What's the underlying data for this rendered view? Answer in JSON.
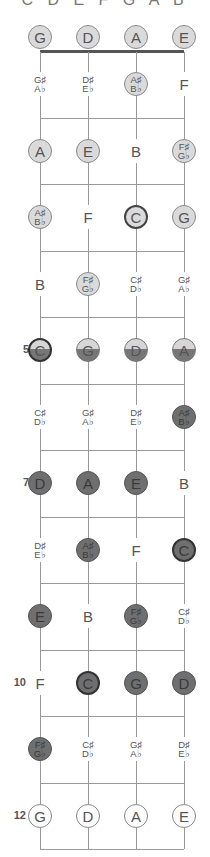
{
  "header": {
    "scale": "C D E F G A B"
  },
  "strings": [
    "G",
    "D",
    "A",
    "E"
  ],
  "colors": {
    "root_light": "#dadada",
    "scale_dark": "#6f6f6f",
    "line": "#9a9a9a",
    "nut": "#555555"
  },
  "fret_markers": [
    {
      "fret": 5,
      "label": "5"
    },
    {
      "fret": 7,
      "label": "7"
    },
    {
      "fret": 10,
      "label": "10"
    },
    {
      "fret": 12,
      "label": "12"
    }
  ],
  "frets": [
    {
      "fret": 0,
      "notes": [
        {
          "n": "G",
          "style": "light"
        },
        {
          "n": "D",
          "style": "light"
        },
        {
          "n": "A",
          "style": "light"
        },
        {
          "n": "E",
          "style": "light"
        }
      ]
    },
    {
      "fret": 1,
      "notes": [
        {
          "n": "G♯",
          "n2": "A♭",
          "style": "plain"
        },
        {
          "n": "D♯",
          "n2": "E♭",
          "style": "plain"
        },
        {
          "n": "A♯",
          "n2": "B♭",
          "style": "light"
        },
        {
          "n": "F",
          "style": "plain"
        }
      ]
    },
    {
      "fret": 2,
      "notes": [
        {
          "n": "A",
          "style": "light"
        },
        {
          "n": "E",
          "style": "light"
        },
        {
          "n": "B",
          "style": "plain"
        },
        {
          "n": "F♯",
          "n2": "G♭",
          "style": "light"
        }
      ]
    },
    {
      "fret": 3,
      "notes": [
        {
          "n": "A♯",
          "n2": "B♭",
          "style": "light"
        },
        {
          "n": "F",
          "style": "plain"
        },
        {
          "n": "C",
          "style": "light-strong"
        },
        {
          "n": "G",
          "style": "light"
        }
      ]
    },
    {
      "fret": 4,
      "notes": [
        {
          "n": "B",
          "style": "plain"
        },
        {
          "n": "F♯",
          "n2": "G♭",
          "style": "light"
        },
        {
          "n": "C♯",
          "n2": "D♭",
          "style": "plain"
        },
        {
          "n": "G♯",
          "n2": "A♭",
          "style": "plain"
        }
      ]
    },
    {
      "fret": 5,
      "notes": [
        {
          "n": "C",
          "style": "half-strong"
        },
        {
          "n": "G",
          "style": "half"
        },
        {
          "n": "D",
          "style": "half"
        },
        {
          "n": "A",
          "style": "half"
        }
      ]
    },
    {
      "fret": 6,
      "notes": [
        {
          "n": "C♯",
          "n2": "D♭",
          "style": "plain"
        },
        {
          "n": "G♯",
          "n2": "A♭",
          "style": "plain"
        },
        {
          "n": "D♯",
          "n2": "E♭",
          "style": "plain"
        },
        {
          "n": "A♯",
          "n2": "B♭",
          "style": "dark"
        }
      ]
    },
    {
      "fret": 7,
      "notes": [
        {
          "n": "D",
          "style": "dark"
        },
        {
          "n": "A",
          "style": "dark"
        },
        {
          "n": "E",
          "style": "dark"
        },
        {
          "n": "B",
          "style": "plain"
        }
      ]
    },
    {
      "fret": 8,
      "notes": [
        {
          "n": "D♯",
          "n2": "E♭",
          "style": "plain"
        },
        {
          "n": "A♯",
          "n2": "B♭",
          "style": "dark"
        },
        {
          "n": "F",
          "style": "plain"
        },
        {
          "n": "C",
          "style": "dark-strong"
        }
      ]
    },
    {
      "fret": 9,
      "notes": [
        {
          "n": "E",
          "style": "dark"
        },
        {
          "n": "B",
          "style": "plain"
        },
        {
          "n": "F♯",
          "n2": "G♭",
          "style": "dark"
        },
        {
          "n": "C♯",
          "n2": "D♭",
          "style": "plain"
        }
      ]
    },
    {
      "fret": 10,
      "notes": [
        {
          "n": "F",
          "style": "plain"
        },
        {
          "n": "C",
          "style": "dark-strong"
        },
        {
          "n": "G",
          "style": "dark"
        },
        {
          "n": "D",
          "style": "dark"
        }
      ]
    },
    {
      "fret": 11,
      "notes": [
        {
          "n": "F♯",
          "n2": "G♭",
          "style": "dark"
        },
        {
          "n": "C♯",
          "n2": "D♭",
          "style": "plain"
        },
        {
          "n": "G♯",
          "n2": "A♭",
          "style": "plain"
        },
        {
          "n": "D♯",
          "n2": "E♭",
          "style": "plain"
        }
      ]
    },
    {
      "fret": 12,
      "notes": [
        {
          "n": "G",
          "style": "outline"
        },
        {
          "n": "D",
          "style": "outline"
        },
        {
          "n": "A",
          "style": "outline"
        },
        {
          "n": "E",
          "style": "outline"
        }
      ]
    }
  ]
}
